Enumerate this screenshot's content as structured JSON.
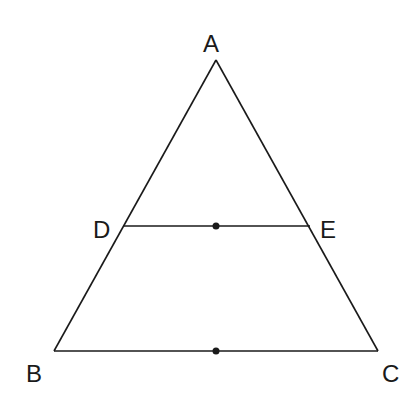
{
  "diagram": {
    "type": "triangle-midsegment",
    "line_color": "#1a1a1a",
    "background": "#ffffff",
    "points": {
      "A": {
        "label": "A",
        "x": 216,
        "y": 60,
        "label_x": 203,
        "label_y": 52
      },
      "B": {
        "label": "B",
        "x": 54,
        "y": 351,
        "label_x": 26,
        "label_y": 382
      },
      "C": {
        "label": "C",
        "x": 378,
        "y": 351,
        "label_x": 382,
        "label_y": 382
      },
      "D": {
        "label": "D",
        "x": 123,
        "y": 226,
        "label_x": 93,
        "label_y": 238
      },
      "E": {
        "label": "E",
        "x": 310,
        "y": 226,
        "label_x": 320,
        "label_y": 238
      }
    },
    "segments": [
      {
        "from": "A",
        "to": "B"
      },
      {
        "from": "A",
        "to": "C"
      },
      {
        "from": "B",
        "to": "C"
      },
      {
        "from": "D",
        "to": "E"
      }
    ],
    "marked_points": [
      {
        "name": "midpoint-DE",
        "x": 216,
        "y": 226
      },
      {
        "name": "midpoint-BC",
        "x": 216,
        "y": 351
      }
    ]
  }
}
